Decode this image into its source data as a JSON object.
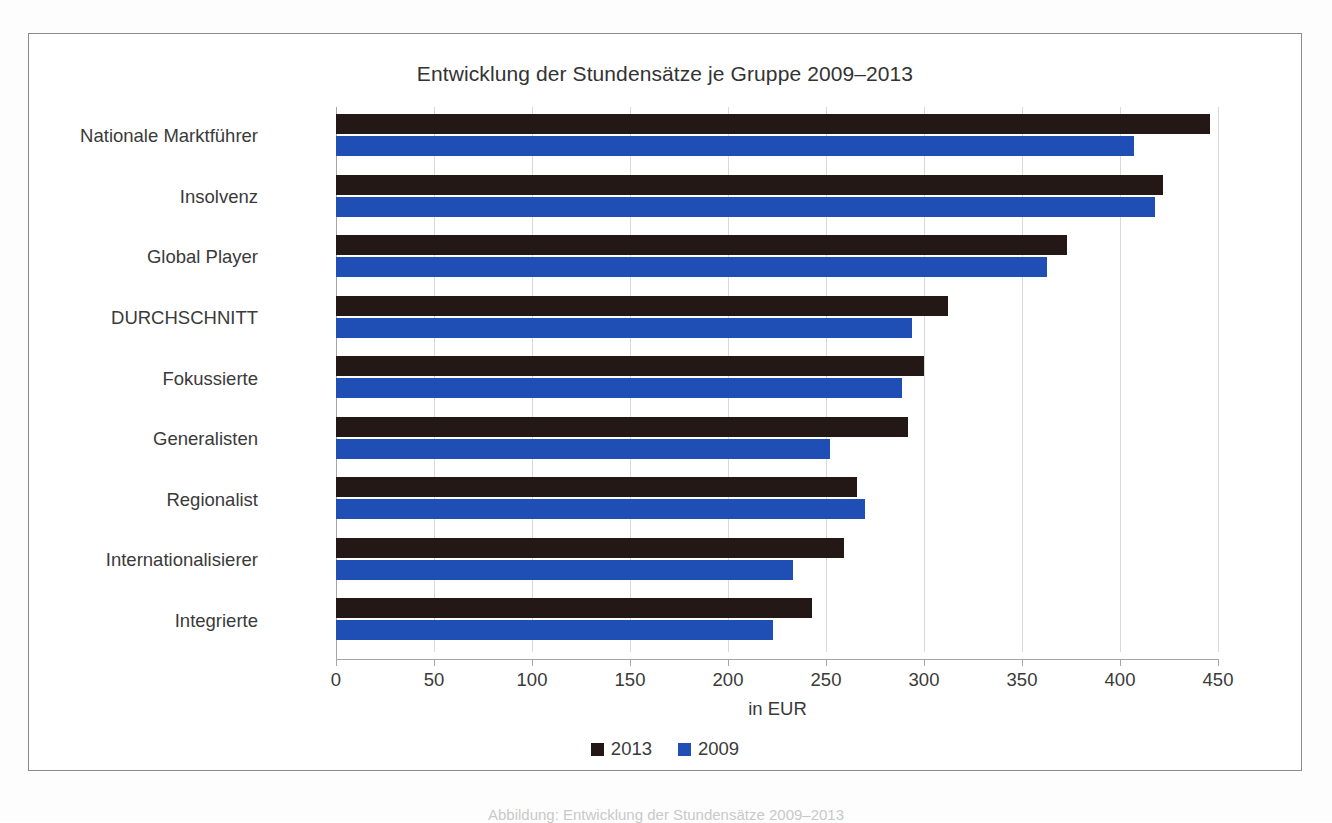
{
  "chart_data": {
    "type": "bar",
    "orientation": "horizontal",
    "title": "Entwicklung der Stundensätze je Gruppe 2009–2013",
    "xlabel": "in EUR",
    "ylabel": "",
    "xlim": [
      0,
      450
    ],
    "xticks": [
      0,
      50,
      100,
      150,
      200,
      250,
      300,
      350,
      400,
      450
    ],
    "grid": true,
    "legend_position": "bottom",
    "categories": [
      "Nationale Marktführer",
      "Insolvenz",
      "Global Player",
      "DURCHSCHNITT",
      "Fokussierte",
      "Generalisten",
      "Regionalist",
      "Internationalisierer",
      "Integrierte"
    ],
    "series": [
      {
        "name": "2013",
        "color": "#231815",
        "values": [
          446,
          422,
          373,
          312,
          300,
          292,
          266,
          259,
          243
        ]
      },
      {
        "name": "2009",
        "color": "#1f4fb5",
        "values": [
          407,
          418,
          363,
          294,
          289,
          252,
          270,
          233,
          223
        ]
      }
    ]
  },
  "caption": "Abbildung: Entwicklung der Stundensätze 2009–2013"
}
